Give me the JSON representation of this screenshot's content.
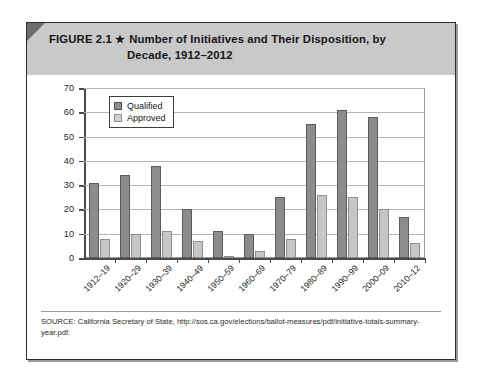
{
  "figure": {
    "label": "FIGURE 2.1",
    "star": "★",
    "title_line1": "Number of Initiatives and Their Disposition, by",
    "title_line2": "Decade, 1912–2012",
    "source": "SOURCE: California Secretary of State, http://sos.ca.gov/elections/ballot-measures/pdf/initiative-totals-summary-year.pdf."
  },
  "colors": {
    "header_band": "#c9c9c9",
    "qualified": "#8c8c8c",
    "approved": "#c6c6c6",
    "frame": "#2b2b2b",
    "gridline": "#b4b4b4"
  },
  "chart_data": {
    "type": "bar",
    "title": "Number of Initiatives and Their Disposition, by Decade, 1912–2012",
    "xlabel": "",
    "ylabel": "",
    "ylim": [
      0,
      70
    ],
    "yticks": [
      0,
      10,
      20,
      30,
      40,
      50,
      60,
      70
    ],
    "grid": true,
    "legend_position": "top-left-inside",
    "categories": [
      "1912–19",
      "1920–29",
      "1930–39",
      "1940–49",
      "1950–59",
      "1960–69",
      "1970–79",
      "1980–89",
      "1990–99",
      "2000–09",
      "2010–12"
    ],
    "series": [
      {
        "name": "Qualified",
        "values": [
          31,
          34,
          38,
          20,
          11,
          10,
          25,
          55,
          61,
          58,
          17
        ]
      },
      {
        "name": "Approved",
        "values": [
          8,
          10,
          11,
          7,
          1,
          3,
          8,
          26,
          25,
          20,
          6
        ]
      }
    ]
  }
}
